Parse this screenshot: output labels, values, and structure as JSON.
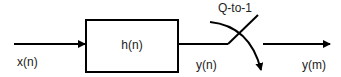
{
  "diagram": {
    "type": "signal-flow",
    "input_label": "x(n)",
    "filter_label": "h(n)",
    "filter_output_label": "y(n)",
    "switch_label": "Q-to-1",
    "output_label": "y(m)",
    "colors": {
      "stroke": "#000000",
      "text": "#222222",
      "background": "#ffffff"
    }
  }
}
